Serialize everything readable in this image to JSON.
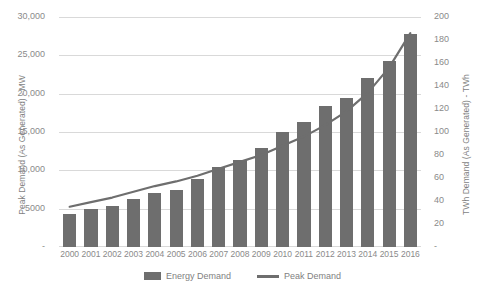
{
  "chart_data": {
    "type": "bar",
    "title": "",
    "subtitle": "",
    "xlabel": "",
    "ylabel": "Peak Demand (As Generated) - MW",
    "y2label": "TWh Demand (As Generated) - TWh",
    "categories": [
      "2000",
      "2001",
      "2002",
      "2003",
      "2004",
      "2005",
      "2006",
      "2007",
      "2008",
      "2009",
      "2010",
      "2011",
      "2012",
      "2013",
      "2014",
      "2015",
      "2016"
    ],
    "ylim": [
      0,
      30000
    ],
    "y2lim": [
      0,
      200
    ],
    "yticks": [
      0,
      5000,
      10000,
      15000,
      20000,
      25000,
      30000
    ],
    "ytick_labels": [
      "-",
      "5000",
      "10,000",
      "15,000",
      "20,000",
      "25,000",
      "30,000"
    ],
    "y2ticks": [
      0,
      20,
      40,
      60,
      80,
      100,
      120,
      140,
      160,
      180,
      200
    ],
    "y2tick_labels": [
      "-",
      "20",
      "40",
      "60",
      "80",
      "100",
      "120",
      "140",
      "160",
      "180",
      "200"
    ],
    "grid": true,
    "legend_position": "bottom",
    "series": [
      {
        "name": "Energy Demand",
        "type": "bar",
        "axis": "left",
        "unit": "MW",
        "color": "#6e6e6e",
        "values": [
          4300,
          4900,
          5400,
          6200,
          7100,
          7400,
          8900,
          10400,
          11400,
          12900,
          15000,
          16300,
          18400,
          19400,
          22100,
          24300,
          27800
        ]
      },
      {
        "name": "Peak Demand",
        "type": "line",
        "axis": "right",
        "unit": "TWh",
        "color": "#6e6e6e",
        "values": [
          35,
          39,
          43,
          48,
          53,
          57,
          62,
          68,
          74,
          80,
          88,
          96,
          106,
          118,
          134,
          156,
          186
        ]
      }
    ]
  },
  "legend": {
    "items": [
      {
        "label": "Energy Demand",
        "marker": "bar-swatch"
      },
      {
        "label": "Peak Demand",
        "marker": "line-swatch"
      }
    ]
  }
}
